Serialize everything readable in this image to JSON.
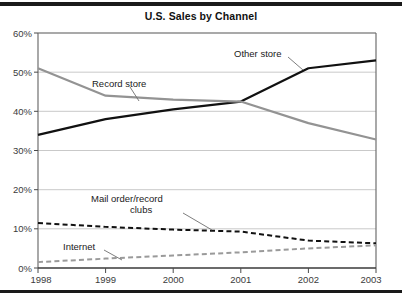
{
  "figure": {
    "title": "U.S. Sales by Channel",
    "top_rule": "decorative-rule",
    "bottom_rule": "decorative-rule"
  },
  "axis": {
    "y_ticks": [
      "0%",
      "10%",
      "20%",
      "30%",
      "40%",
      "50%",
      "60%"
    ],
    "x_ticks": [
      "1998",
      "1999",
      "2000",
      "2001",
      "2002",
      "2003"
    ]
  },
  "labels": {
    "other_store": "Other store",
    "record_store": "Record store",
    "mail_order_line1": "Mail order/record",
    "mail_order_line2": "clubs",
    "internet": "Internet"
  },
  "colors": {
    "other_store": "#111111",
    "record_store": "#939393",
    "mail_order": "#111111",
    "internet": "#9a9a9a",
    "grid": "#c9c9c9",
    "frame": "#6f6f6f",
    "text": "#1a1a1a",
    "rule": "#1a1a1a"
  },
  "chart_data": {
    "type": "line",
    "title": "U.S. Sales by Channel",
    "xlabel": "",
    "ylabel": "",
    "x": [
      1998,
      1999,
      2000,
      2001,
      2002,
      2003
    ],
    "categories": [
      "1998",
      "1999",
      "2000",
      "2001",
      "2002",
      "2003"
    ],
    "ylim": [
      0,
      60
    ],
    "yticks": [
      0,
      10,
      20,
      30,
      40,
      50,
      60
    ],
    "ytick_format": "percent",
    "grid": "horizontal",
    "legend": "inline-annotations",
    "series": [
      {
        "name": "Other store",
        "color": "#111111",
        "style": "solid",
        "width": 2.2,
        "values": [
          34.0,
          38.0,
          40.5,
          42.5,
          51.0,
          53.0
        ]
      },
      {
        "name": "Record store",
        "color": "#939393",
        "style": "solid",
        "width": 2.2,
        "values": [
          51.0,
          44.0,
          43.0,
          42.5,
          37.0,
          32.8
        ]
      },
      {
        "name": "Mail order/record clubs",
        "color": "#111111",
        "style": "dashed",
        "width": 2.0,
        "values": [
          11.5,
          10.5,
          9.8,
          9.3,
          7.0,
          6.3
        ]
      },
      {
        "name": "Internet",
        "color": "#9a9a9a",
        "style": "dashed",
        "width": 2.0,
        "values": [
          1.5,
          2.4,
          3.2,
          4.0,
          5.0,
          5.8
        ]
      }
    ]
  }
}
